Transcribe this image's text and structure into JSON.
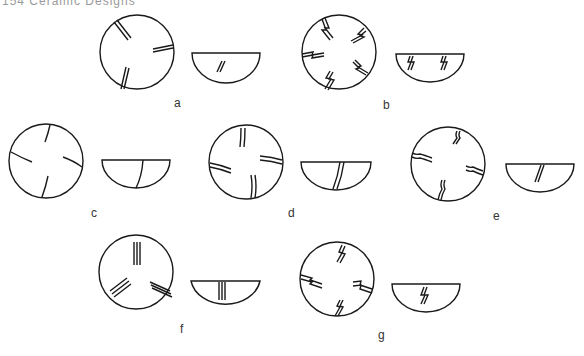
{
  "header": {
    "text": "154   Ceramic Designs"
  },
  "figures": [
    {
      "id": "a",
      "label": "a",
      "motif": "paired parallel lines (3 groups)"
    },
    {
      "id": "b",
      "label": "b",
      "motif": "paired zigzag lightning lines (5 groups)"
    },
    {
      "id": "c",
      "label": "c",
      "motif": "single curved lines (4 groups)"
    },
    {
      "id": "d",
      "label": "d",
      "motif": "paired curved lines (4 groups)"
    },
    {
      "id": "e",
      "label": "e",
      "motif": "paired wavy lines (4 groups)"
    },
    {
      "id": "f",
      "label": "f",
      "motif": "triple parallel lines (3 groups)"
    },
    {
      "id": "g",
      "label": "g",
      "motif": "paired zigzag lightning lines (4 groups)"
    }
  ],
  "style": {
    "stroke": "#1a1a1a",
    "background": "#ffffff"
  }
}
